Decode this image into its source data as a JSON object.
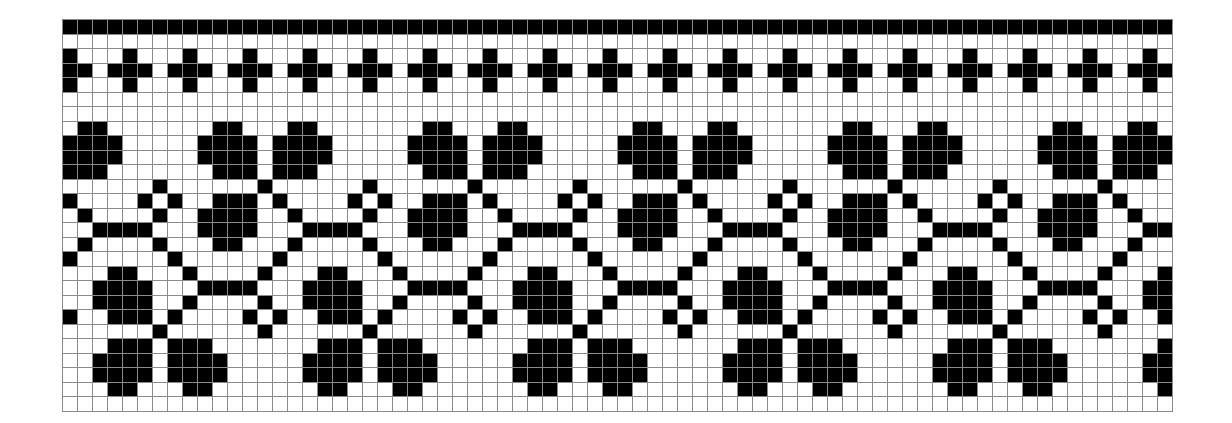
{
  "pattern": {
    "type": "knitting-chart",
    "columns": 74,
    "rows": 27,
    "cell_width": 15,
    "cell_height": 14.5,
    "colors": {
      "filled": "#000000",
      "empty": "#ffffff",
      "grid": "#8a8a8a"
    },
    "repeat_width": 14,
    "repeat_offset": 23,
    "cross_period": 4,
    "cross_offset": 0,
    "border_rows": [
      0
    ],
    "cross_rows": {
      "arm_rows": [
        2,
        4
      ],
      "bar_row": 3
    },
    "motif_rows": {
      "7": [
        1,
        2,
        6,
        7
      ],
      "8": [
        0,
        1,
        2,
        3,
        5,
        6,
        7,
        8
      ],
      "9": [
        0,
        1,
        2,
        3,
        5,
        6,
        7,
        8
      ],
      "10": [
        1,
        2,
        3,
        5,
        6,
        7
      ],
      "11": [
        4,
        11
      ],
      "12": [
        1,
        2,
        3,
        5,
        10,
        12
      ],
      "13": [
        0,
        1,
        2,
        3,
        6,
        11
      ],
      "14": [
        0,
        1,
        2,
        3,
        7,
        8,
        9,
        10
      ],
      "15": [
        1,
        2,
        6,
        11
      ],
      "16": [
        5,
        12
      ],
      "17": [
        4,
        8,
        9,
        13
      ],
      "18": [
        0,
        1,
        2,
        3,
        7,
        8,
        9,
        10
      ],
      "19": [
        4,
        7,
        8,
        9,
        10,
        13
      ],
      "20": [
        3,
        5,
        8,
        9,
        10,
        12
      ],
      "21": [
        4,
        11
      ],
      "22": [
        0,
        8,
        9,
        10,
        12,
        13
      ],
      "23": [
        0,
        1,
        7,
        8,
        9,
        10,
        12,
        13
      ],
      "24": [
        0,
        1,
        7,
        8,
        9,
        10,
        12,
        13
      ],
      "25": [
        0,
        8,
        9,
        13
      ]
    }
  }
}
